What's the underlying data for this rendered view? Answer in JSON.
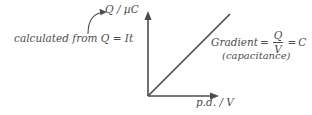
{
  "diagram": {
    "colors": {
      "line": "#4d4d4d",
      "text": "#4d4d4d",
      "background": "#ffffff"
    },
    "axes": {
      "y_label": "Q / µC",
      "x_label": "p.d. / V",
      "origin": {
        "x": 148,
        "y": 96
      },
      "y_tip": {
        "x": 148,
        "y": 12
      },
      "x_tip": {
        "x": 218,
        "y": 96
      }
    },
    "trend_line": {
      "from": {
        "x": 148,
        "y": 96
      },
      "to": {
        "x": 230,
        "y": 14
      },
      "description": "straight line through origin"
    },
    "annotations": {
      "left": {
        "text": "calculated from Q = It",
        "arrow": "curved-arrow-to-y-axis-label"
      },
      "right": {
        "gradient_label": "Gradient",
        "equals": "=",
        "numerator": "Q",
        "denominator": "V",
        "result_equals": "=",
        "result": "C",
        "note": "(capacitance)"
      }
    }
  }
}
